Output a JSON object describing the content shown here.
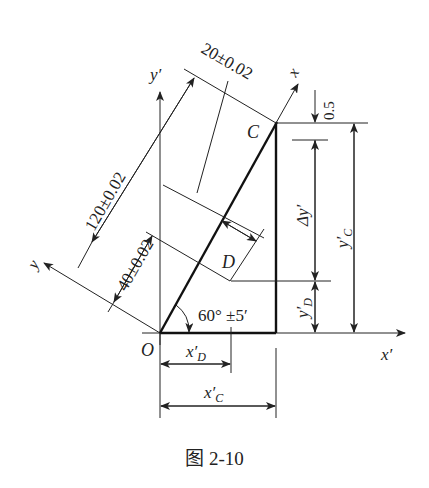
{
  "figure": {
    "caption": "图 2-10",
    "points": {
      "origin": "O",
      "C": "C",
      "D": "D"
    },
    "axes": {
      "x": "x",
      "y": "y",
      "x_prime": "x′",
      "y_prime": "y′"
    },
    "dimensions": {
      "oc_length": "120±0.02",
      "od_length": "40±0.02",
      "offset": "20±0.02",
      "angle": "60° ±5′",
      "top_gap": "0.5",
      "delta_y": "Δy′",
      "y_c": "y′",
      "y_c_sub": "C",
      "y_d": "y′",
      "y_d_sub": "D",
      "x_d": "x′",
      "x_d_sub": "D",
      "x_c": "x′",
      "x_c_sub": "C"
    }
  }
}
